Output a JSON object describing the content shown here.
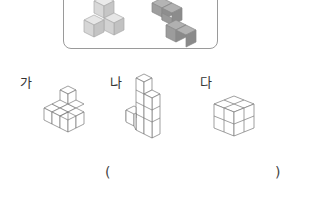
{
  "reference": {
    "figures": [
      {
        "name": "light-gray-cube-piece",
        "color": "#d4d4d4"
      },
      {
        "name": "dark-gray-cube-piece",
        "color": "#9c9c9c"
      }
    ]
  },
  "options": [
    {
      "label": "가"
    },
    {
      "label": "나"
    },
    {
      "label": "다"
    }
  ],
  "answer": {
    "open_paren": "(",
    "close_paren": ")",
    "value": ""
  },
  "colors": {
    "box_border": "#9a9a9a",
    "line": "#777777"
  }
}
